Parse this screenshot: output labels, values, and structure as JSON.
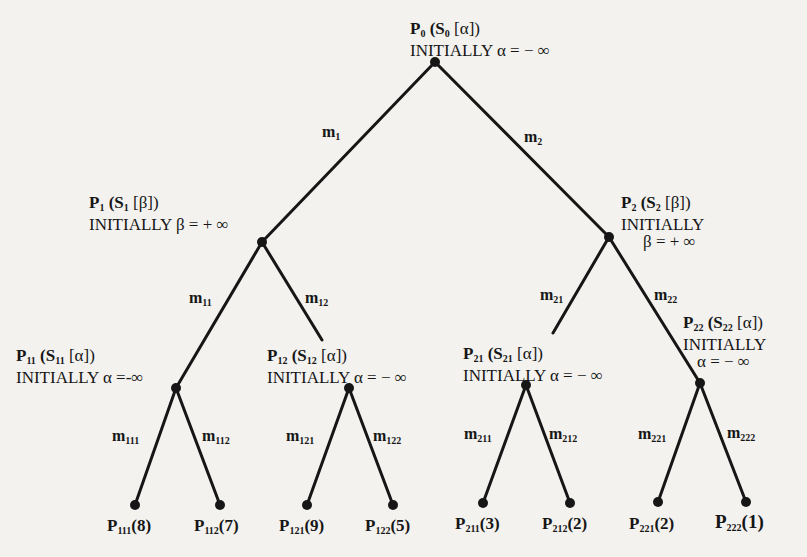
{
  "diagram": {
    "type": "game-tree (alpha-beta search)",
    "nodes": {
      "P0": {
        "name": "P",
        "sub": "0",
        "state": "S",
        "state_sub": "0",
        "bound": "α",
        "init": "INITIALLY",
        "value": "α = − ∞"
      },
      "P1": {
        "name": "P",
        "sub": "1",
        "state": "S",
        "state_sub": "1",
        "bound": "β",
        "init": "INITIALLY",
        "value": "β = + ∞"
      },
      "P2": {
        "name": "P",
        "sub": "2",
        "state": "S",
        "state_sub": "2",
        "bound": "β",
        "init": "INITIALLY",
        "value": "β = + ∞"
      },
      "P11": {
        "name": "P",
        "sub": "11",
        "state": "S",
        "state_sub": "11",
        "bound": "α",
        "init": "INITIALLY",
        "value": "α =-∞"
      },
      "P12": {
        "name": "P",
        "sub": "12",
        "state": "S",
        "state_sub": "12",
        "bound": "α",
        "init": "INITIALLY",
        "value": "α = − ∞"
      },
      "P21": {
        "name": "P",
        "sub": "21",
        "state": "S",
        "state_sub": "21",
        "bound": "α",
        "init": "INITIALLY",
        "value": "α = − ∞"
      },
      "P22": {
        "name": "P",
        "sub": "22",
        "state": "S",
        "state_sub": "22",
        "bound": "α",
        "init": "INITIALLY",
        "value": "α = − ∞"
      }
    },
    "edges": [
      {
        "name": "m",
        "sub": "1"
      },
      {
        "name": "m",
        "sub": "2"
      },
      {
        "name": "m",
        "sub": "11"
      },
      {
        "name": "m",
        "sub": "12"
      },
      {
        "name": "m",
        "sub": "21"
      },
      {
        "name": "m",
        "sub": "22"
      },
      {
        "name": "m",
        "sub": "111"
      },
      {
        "name": "m",
        "sub": "112"
      },
      {
        "name": "m",
        "sub": "121"
      },
      {
        "name": "m",
        "sub": "122"
      },
      {
        "name": "m",
        "sub": "211"
      },
      {
        "name": "m",
        "sub": "212"
      },
      {
        "name": "m",
        "sub": "221"
      },
      {
        "name": "m",
        "sub": "222"
      }
    ],
    "leaves": [
      {
        "name": "P",
        "sub": "111",
        "value": "(8)"
      },
      {
        "name": "P",
        "sub": "112",
        "value": "(7)"
      },
      {
        "name": "P",
        "sub": "121",
        "value": "(9)"
      },
      {
        "name": "P",
        "sub": "122",
        "value": "(5)"
      },
      {
        "name": "P",
        "sub": "211",
        "value": "(3)"
      },
      {
        "name": "P",
        "sub": "212",
        "value": "(2)"
      },
      {
        "name": "P",
        "sub": "221",
        "value": "(2)"
      },
      {
        "name": "P",
        "sub": "222",
        "value": "(1)"
      }
    ],
    "colors": {
      "ink": "#161616",
      "paper": "#f3f2ef"
    }
  }
}
